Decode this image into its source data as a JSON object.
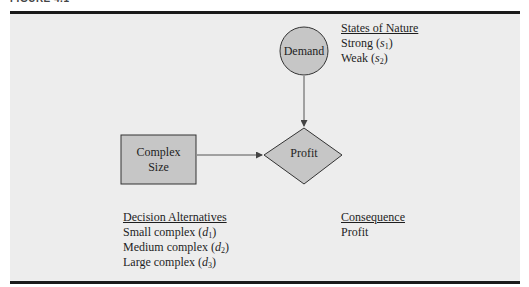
{
  "figure": {
    "label": "FIGURE 4.1"
  },
  "nodes": {
    "chance": {
      "label": "Demand",
      "shape": "circle"
    },
    "decision": {
      "label_line1": "Complex",
      "label_line2": "Size",
      "shape": "rectangle"
    },
    "consequence": {
      "label": "Profit",
      "shape": "diamond"
    }
  },
  "edges": [
    {
      "from": "Demand",
      "to": "Profit"
    },
    {
      "from": "Complex Size",
      "to": "Profit"
    }
  ],
  "states_of_nature": {
    "heading": "States of Nature",
    "items": [
      {
        "text": "Strong (",
        "var": "s",
        "sub": "1",
        "close": ")"
      },
      {
        "text": "Weak (",
        "var": "s",
        "sub": "2",
        "close": ")"
      }
    ]
  },
  "decision_alternatives": {
    "heading": "Decision Alternatives",
    "items": [
      {
        "text": "Small complex (",
        "var": "d",
        "sub": "1",
        "close": ")"
      },
      {
        "text": "Medium complex (",
        "var": "d",
        "sub": "2",
        "close": ")"
      },
      {
        "text": "Large complex (",
        "var": "d",
        "sub": "3",
        "close": ")"
      }
    ]
  },
  "consequence": {
    "heading": "Consequence",
    "items": [
      {
        "text": "Profit"
      }
    ]
  },
  "colors": {
    "panel": "#ededed",
    "node_fill": "#c6c6c6",
    "stroke": "#333333",
    "rule": "#1a1a1a"
  }
}
